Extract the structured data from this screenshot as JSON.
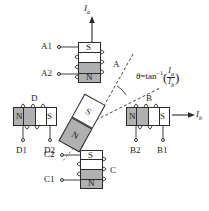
{
  "figure": {
    "colors": {
      "north_pole_fill": "#b0b0b0",
      "south_pole_fill": "#ffffff",
      "line": "#2b2b2b",
      "text": "#1a1a1a"
    }
  },
  "currents": {
    "vertical": {
      "symbol": "I",
      "subscript": "a",
      "direction": "up"
    },
    "horizontal": {
      "symbol": "I",
      "subscript": "b",
      "direction": "right"
    }
  },
  "angle_formula": {
    "theta": "θ",
    "equals": "=",
    "function": "tan",
    "exponent": "−1",
    "numerator": "I",
    "numerator_sub": "a",
    "denominator": "I",
    "denominator_sub": "b",
    "open_paren": "(",
    "close_paren": ")"
  },
  "coils": [
    {
      "id": "A",
      "name_label": "A",
      "orientation": "vertical",
      "position": "top",
      "poles": [
        {
          "label": "S",
          "fill": "south"
        },
        {
          "label": "",
          "fill": "south"
        },
        {
          "label": "",
          "fill": "north"
        },
        {
          "label": "N",
          "fill": "north"
        }
      ],
      "terminals": [
        {
          "label": "A1",
          "side": "left-top"
        },
        {
          "label": "A2",
          "side": "left-bottom"
        }
      ]
    },
    {
      "id": "B",
      "name_label": "B",
      "orientation": "horizontal",
      "position": "right",
      "poles": [
        {
          "label": "N",
          "fill": "north"
        },
        {
          "label": "",
          "fill": "north"
        },
        {
          "label": "",
          "fill": "south"
        },
        {
          "label": "S",
          "fill": "south"
        }
      ],
      "terminals": [
        {
          "label": "B2",
          "side": "bottom-left"
        },
        {
          "label": "B1",
          "side": "bottom-right"
        }
      ]
    },
    {
      "id": "C",
      "name_label": "C",
      "orientation": "vertical",
      "position": "bottom",
      "poles": [
        {
          "label": "S",
          "fill": "south"
        },
        {
          "label": "",
          "fill": "south"
        },
        {
          "label": "",
          "fill": "north"
        },
        {
          "label": "N",
          "fill": "north"
        }
      ],
      "terminals": [
        {
          "label": "C2",
          "side": "left-top"
        },
        {
          "label": "C1",
          "side": "left-bottom"
        }
      ]
    },
    {
      "id": "D",
      "name_label": "D",
      "orientation": "horizontal",
      "position": "left",
      "poles": [
        {
          "label": "N",
          "fill": "north"
        },
        {
          "label": "",
          "fill": "north"
        },
        {
          "label": "",
          "fill": "south"
        },
        {
          "label": "S",
          "fill": "south"
        }
      ],
      "terminals": [
        {
          "label": "D1",
          "side": "bottom-left"
        },
        {
          "label": "D2",
          "side": "bottom-right"
        }
      ]
    }
  ],
  "rotor": {
    "north_label": "N",
    "south_label": "S",
    "tilt_degrees": 29,
    "axis_style": "dashed"
  }
}
